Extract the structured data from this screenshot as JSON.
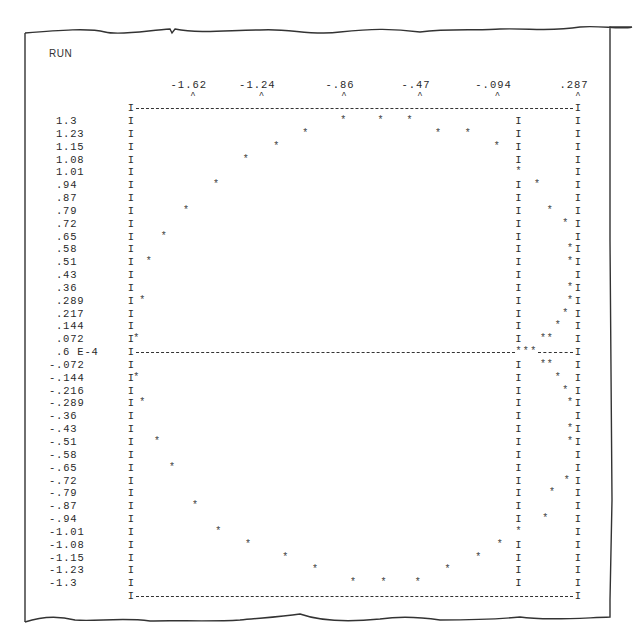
{
  "header": {
    "run_label": "RUN"
  },
  "chart_data": {
    "type": "scatter",
    "title": "RUN",
    "style": "line-printer character plot (phase-plane trajectory)",
    "xlabel": "",
    "ylabel": "",
    "x_ticks": [
      "-1.62",
      "-1.24",
      "-.86",
      "-.47",
      "-.094",
      ".287"
    ],
    "x_tick_values": [
      -1.62,
      -1.24,
      -0.86,
      -0.47,
      -0.094,
      0.287
    ],
    "y_ticks": [
      "1.3",
      "1.23",
      "1.15",
      "1.08",
      "1.01",
      ".94",
      ".87",
      ".79",
      ".72",
      ".65",
      ".58",
      ".51",
      ".43",
      ".36",
      ".289",
      ".217",
      ".144",
      ".072",
      ".6 E-4",
      "-.072",
      "-.144",
      "-.216",
      "-.289",
      "-.36",
      "-.43",
      "-.51",
      "-.58",
      "-.65",
      "-.72",
      "-.79",
      "-.87",
      "-.94",
      "-1.01",
      "-1.08",
      "-1.15",
      "-1.23",
      "-1.3"
    ],
    "xlim": [
      -1.81,
      0.287
    ],
    "ylim": [
      -1.3,
      1.3
    ],
    "grid": false,
    "legend": null,
    "plot_symbol": "*",
    "axis_symbol": "I",
    "columns": 60,
    "interior_axis_column": 52,
    "zero_row": 18,
    "points_grid": [
      {
        "row": 0,
        "cols": [
          28.5,
          33.5,
          37.4
        ]
      },
      {
        "row": 1,
        "cols": [
          23.4,
          41.2,
          45.2
        ]
      },
      {
        "row": 2,
        "cols": [
          19.5,
          49.1
        ]
      },
      {
        "row": 3,
        "cols": [
          15.4
        ]
      },
      {
        "row": 4,
        "cols": [
          52
        ]
      },
      {
        "row": 5,
        "cols": [
          11.4,
          54.5
        ]
      },
      {
        "row": 7,
        "cols": [
          7.4,
          56.2
        ]
      },
      {
        "row": 8,
        "cols": [
          58.3
        ]
      },
      {
        "row": 9,
        "cols": [
          4.4
        ]
      },
      {
        "row": 10,
        "cols": [
          59.2
        ]
      },
      {
        "row": 11,
        "cols": [
          2.4,
          59.2
        ]
      },
      {
        "row": 13,
        "cols": [
          59.2
        ]
      },
      {
        "row": 14,
        "cols": [
          1.5,
          59.2
        ]
      },
      {
        "row": 15,
        "cols": [
          58.3
        ]
      },
      {
        "row": 16,
        "cols": [
          57.3
        ]
      },
      {
        "row": 17,
        "cols": [
          0.7,
          55.3,
          56.2
        ]
      },
      {
        "row": 18,
        "cols": [
          52,
          53,
          54
        ]
      },
      {
        "row": 19,
        "cols": [
          55.3,
          56.2
        ]
      },
      {
        "row": 20,
        "cols": [
          0.7,
          57.3
        ]
      },
      {
        "row": 21,
        "cols": [
          58.3
        ]
      },
      {
        "row": 22,
        "cols": [
          1.5,
          59.2
        ]
      },
      {
        "row": 24,
        "cols": [
          59.2
        ]
      },
      {
        "row": 25,
        "cols": [
          3.5,
          59.2
        ]
      },
      {
        "row": 27,
        "cols": [
          5.5
        ]
      },
      {
        "row": 28,
        "cols": [
          58.5
        ]
      },
      {
        "row": 29,
        "cols": [
          56.5
        ]
      },
      {
        "row": 30,
        "cols": [
          8.6
        ]
      },
      {
        "row": 31,
        "cols": [
          55.6
        ]
      },
      {
        "row": 32,
        "cols": [
          11.7,
          52
        ]
      },
      {
        "row": 33,
        "cols": [
          15.7,
          49.5
        ]
      },
      {
        "row": 34,
        "cols": [
          20.7,
          46.6
        ]
      },
      {
        "row": 35,
        "cols": [
          24.7,
          42.5
        ]
      },
      {
        "row": 36,
        "cols": [
          29.8,
          33.9,
          38.5
        ]
      }
    ],
    "series": [
      {
        "name": "outer trajectory (large circle)",
        "x": [
          -0.86,
          -0.62,
          -0.45,
          -1.1,
          0.0,
          -0.24,
          -1.3,
          -1.49,
          -1.64,
          -1.76,
          -1.78,
          -1.81,
          -1.75,
          -1.65,
          -1.49,
          -1.3,
          -1.09,
          -0.84,
          -0.62,
          -0.45,
          -0.24,
          -0.07,
          0.08,
          0.21,
          -0.15,
          -0.86,
          -0.92,
          -0.59
        ],
        "y": [
          1.3,
          1.3,
          1.3,
          1.23,
          1.23,
          1.15,
          1.08,
          0.94,
          0.79,
          0.65,
          0.51,
          0.289,
          0.072,
          -0.144,
          -0.289,
          -0.51,
          -0.65,
          -0.87,
          -1.01,
          -1.08,
          -1.15,
          -1.23,
          -1.23,
          -1.3,
          -1.3,
          -1.3,
          -1.15,
          -1.08
        ]
      },
      {
        "name": "inner trajectory (small loop)",
        "x": [
          0.0,
          0.1,
          0.16,
          0.25,
          0.27,
          0.27,
          0.27,
          0.25,
          0.21,
          0.14,
          0.19,
          0.0,
          0.05,
          0.1,
          0.14,
          0.19,
          0.21,
          0.25,
          0.27,
          0.27,
          0.27,
          0.26,
          0.17,
          0.13,
          0.0
        ],
        "y": [
          1.01,
          0.94,
          0.79,
          0.72,
          0.58,
          0.51,
          0.36,
          0.289,
          0.217,
          0.144,
          0.072,
          6e-05,
          -0.072,
          -0.144,
          -0.216,
          -0.289,
          -0.43,
          -0.51,
          -0.72,
          -0.79,
          -0.94,
          -1.01,
          0.072,
          -0.072,
          0.0
        ]
      }
    ]
  }
}
